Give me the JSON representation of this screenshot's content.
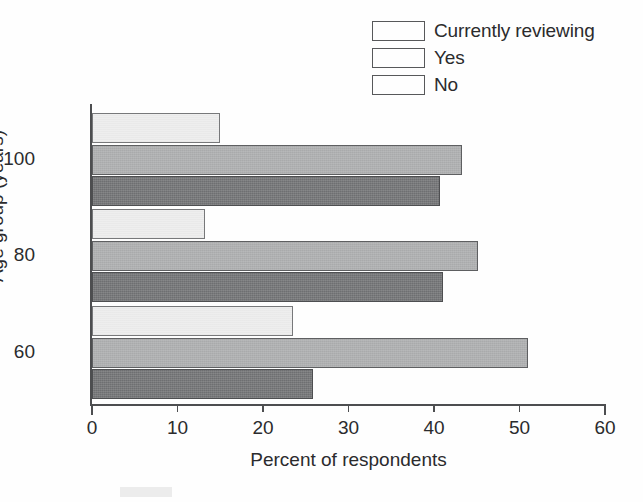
{
  "chart_data": {
    "type": "bar",
    "orientation": "horizontal",
    "title": "",
    "xlabel": "Percent of respondents",
    "ylabel": "Age group (years)",
    "categories": [
      "100",
      "80",
      "60"
    ],
    "xlim": [
      0,
      60
    ],
    "xticks": [
      0,
      10,
      20,
      30,
      40,
      50,
      60
    ],
    "xtick_labels": [
      "0",
      "10",
      "20",
      "30",
      "40",
      "50",
      "60"
    ],
    "grid": false,
    "legend_position": "top-right",
    "series": [
      {
        "name": "Currently reviewing",
        "color": "#eeeeee",
        "values": [
          15.0,
          13.2,
          23.5
        ]
      },
      {
        "name": "Yes",
        "color": "#a9aaab",
        "values": [
          43.3,
          45.1,
          51.0
        ]
      },
      {
        "name": "No",
        "color": "#6e6f71",
        "values": [
          40.7,
          41.0,
          25.8
        ]
      }
    ]
  },
  "legend": {
    "items": [
      {
        "label": "Currently reviewing",
        "swatch_color": "#eeeeee"
      },
      {
        "label": "Yes",
        "swatch_color": "#a9aaab"
      },
      {
        "label": "No",
        "swatch_color": "#6e6f71"
      }
    ]
  },
  "axes": {
    "x_title": "Percent of respondents",
    "y_title": "Age group (years)",
    "x_tick_labels": [
      "0",
      "10",
      "20",
      "30",
      "40",
      "50",
      "60"
    ],
    "y_group_labels": [
      "100",
      "80",
      "60"
    ]
  },
  "colors": {
    "axis": "#4d4e50",
    "text": "#2b2b2d",
    "background": "#fefefe"
  }
}
